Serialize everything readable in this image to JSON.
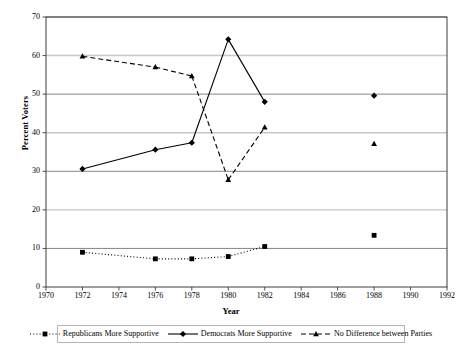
{
  "chart_data": {
    "type": "line",
    "title": "",
    "xlabel": "Year",
    "ylabel": "Percent Voters",
    "xlim": [
      1970,
      1992
    ],
    "ylim": [
      0,
      70
    ],
    "xticks": [
      1970,
      1972,
      1974,
      1976,
      1978,
      1980,
      1982,
      1984,
      1986,
      1988,
      1990,
      1992
    ],
    "yticks": [
      0,
      10,
      20,
      30,
      40,
      50,
      60,
      70
    ],
    "grid": true,
    "legend_position": "bottom",
    "series": [
      {
        "name": "Republicans More Supportive",
        "marker": "square",
        "linestyle": "dotted",
        "color": "#000000",
        "points": [
          {
            "x": 1972,
            "y": 9.0,
            "connected": false
          },
          {
            "x": 1976,
            "y": 7.3,
            "connected": true
          },
          {
            "x": 1978,
            "y": 7.3,
            "connected": true
          },
          {
            "x": 1980,
            "y": 7.9,
            "connected": true
          },
          {
            "x": 1982,
            "y": 10.5,
            "connected": true
          },
          {
            "x": 1988,
            "y": 13.4,
            "connected": false
          }
        ]
      },
      {
        "name": "Democrats More Supportive",
        "marker": "diamond",
        "linestyle": "solid",
        "color": "#000000",
        "points": [
          {
            "x": 1972,
            "y": 30.6,
            "connected": false
          },
          {
            "x": 1976,
            "y": 35.6,
            "connected": true
          },
          {
            "x": 1978,
            "y": 37.4,
            "connected": true
          },
          {
            "x": 1980,
            "y": 64.2,
            "connected": true
          },
          {
            "x": 1982,
            "y": 48.0,
            "connected": true
          },
          {
            "x": 1988,
            "y": 49.6,
            "connected": false
          }
        ]
      },
      {
        "name": "No Difference between Parties",
        "marker": "triangle",
        "linestyle": "dashed",
        "color": "#000000",
        "points": [
          {
            "x": 1972,
            "y": 59.8,
            "connected": false
          },
          {
            "x": 1976,
            "y": 57.0,
            "connected": true
          },
          {
            "x": 1978,
            "y": 54.7,
            "connected": true
          },
          {
            "x": 1980,
            "y": 27.8,
            "connected": true
          },
          {
            "x": 1982,
            "y": 41.4,
            "connected": true
          },
          {
            "x": 1988,
            "y": 37.1,
            "connected": false
          }
        ]
      }
    ]
  },
  "axis": {
    "y_title": "Percent Voters",
    "x_title": "Year",
    "y_tick_labels": [
      "0",
      "10",
      "20",
      "30",
      "40",
      "50",
      "60",
      "70"
    ],
    "x_tick_labels": [
      "1970",
      "1972",
      "1974",
      "1976",
      "1978",
      "1980",
      "1982",
      "1984",
      "1986",
      "1988",
      "1990",
      "1992"
    ]
  },
  "legend": {
    "items": [
      {
        "label": "Republicans More Supportive",
        "marker": "square-marker",
        "linestyle": "dotted"
      },
      {
        "label": "Democrats More Supportive",
        "marker": "diamond-marker",
        "linestyle": "solid"
      },
      {
        "label": "No Difference between Parties",
        "marker": "triangle-marker",
        "linestyle": "dashed"
      }
    ]
  },
  "colors": {
    "plot_border": "#3c3c3c",
    "grid_light": "#c8c8c8",
    "grid_dark": "#787878",
    "series_ink": "#000000",
    "background": "#ffffff"
  }
}
